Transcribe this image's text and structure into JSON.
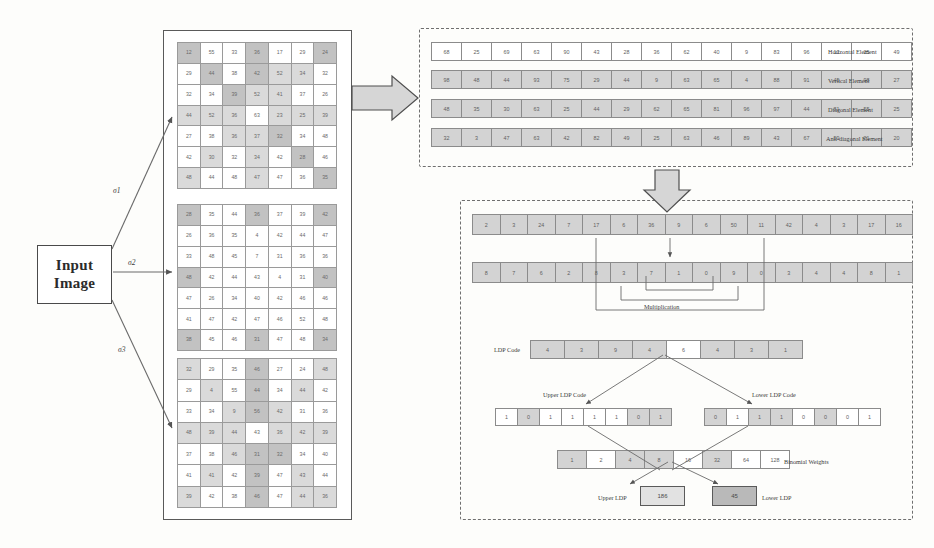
{
  "diagram": {
    "input": {
      "line1": "Input",
      "line2": "Image"
    },
    "sigma_labels": [
      "σ1",
      "σ2",
      "σ3"
    ]
  },
  "grids": [
    {
      "name": "scale-1-grid",
      "rows": 7,
      "cols": 7,
      "values": [
        [
          "12",
          "55",
          "33",
          "36",
          "17",
          "29",
          "24"
        ],
        [
          "29",
          "44",
          "38",
          "42",
          "52",
          "34",
          "32"
        ],
        [
          "32",
          "34",
          "39",
          "52",
          "41",
          "37",
          "26"
        ],
        [
          "44",
          "52",
          "36",
          "63",
          "23",
          "25",
          "39"
        ],
        [
          "27",
          "38",
          "36",
          "37",
          "32",
          "34",
          "48"
        ],
        [
          "42",
          "30",
          "32",
          "34",
          "42",
          "28",
          "46"
        ],
        [
          "48",
          "44",
          "48",
          "47",
          "47",
          "36",
          "35"
        ]
      ],
      "shades": [
        [
          2,
          0,
          0,
          2,
          0,
          0,
          2
        ],
        [
          0,
          2,
          0,
          2,
          1,
          1,
          0
        ],
        [
          0,
          0,
          2,
          1,
          1,
          0,
          0
        ],
        [
          1,
          1,
          1,
          0,
          1,
          1,
          1
        ],
        [
          0,
          0,
          1,
          1,
          2,
          0,
          0
        ],
        [
          0,
          1,
          0,
          1,
          0,
          2,
          0
        ],
        [
          1,
          0,
          0,
          1,
          0,
          0,
          2
        ]
      ]
    },
    {
      "name": "scale-2-grid",
      "rows": 7,
      "cols": 7,
      "values": [
        [
          "28",
          "35",
          "44",
          "36",
          "37",
          "39",
          "42"
        ],
        [
          "26",
          "36",
          "35",
          "4",
          "42",
          "44",
          "47"
        ],
        [
          "33",
          "48",
          "45",
          "7",
          "31",
          "36",
          "36"
        ],
        [
          "48",
          "42",
          "44",
          "43",
          "4",
          "31",
          "40"
        ],
        [
          "47",
          "26",
          "34",
          "40",
          "42",
          "46",
          "46"
        ],
        [
          "41",
          "47",
          "42",
          "47",
          "46",
          "52",
          "48"
        ],
        [
          "38",
          "45",
          "46",
          "31",
          "47",
          "48",
          "34"
        ]
      ],
      "shades": [
        [
          2,
          0,
          0,
          2,
          0,
          0,
          2
        ],
        [
          0,
          0,
          0,
          0,
          0,
          0,
          0
        ],
        [
          0,
          0,
          0,
          0,
          0,
          0,
          0
        ],
        [
          2,
          0,
          0,
          0,
          0,
          0,
          2
        ],
        [
          0,
          0,
          0,
          0,
          0,
          0,
          0
        ],
        [
          0,
          0,
          0,
          0,
          0,
          0,
          0
        ],
        [
          2,
          0,
          0,
          2,
          0,
          0,
          2
        ]
      ]
    },
    {
      "name": "scale-3-grid",
      "rows": 7,
      "cols": 7,
      "values": [
        [
          "32",
          "29",
          "35",
          "46",
          "27",
          "24",
          "48"
        ],
        [
          "29",
          "4",
          "55",
          "44",
          "34",
          "44",
          "42"
        ],
        [
          "33",
          "34",
          "9",
          "56",
          "42",
          "31",
          "36"
        ],
        [
          "48",
          "39",
          "44",
          "43",
          "36",
          "42",
          "39"
        ],
        [
          "37",
          "38",
          "46",
          "31",
          "32",
          "34",
          "40"
        ],
        [
          "41",
          "41",
          "42",
          "39",
          "47",
          "43",
          "44"
        ],
        [
          "39",
          "42",
          "38",
          "46",
          "47",
          "44",
          "36"
        ]
      ],
      "shades": [
        [
          1,
          0,
          0,
          2,
          0,
          0,
          1
        ],
        [
          0,
          1,
          0,
          2,
          0,
          1,
          0
        ],
        [
          0,
          0,
          1,
          2,
          1,
          0,
          0
        ],
        [
          1,
          1,
          1,
          0,
          1,
          1,
          1
        ],
        [
          0,
          0,
          1,
          2,
          2,
          0,
          0
        ],
        [
          0,
          1,
          0,
          2,
          0,
          1,
          0
        ],
        [
          1,
          0,
          0,
          2,
          0,
          1,
          1
        ]
      ]
    }
  ],
  "masks": {
    "label_horizontal": "Horizontal Element",
    "label_vertical": "Vertical Element",
    "label_diagonal": "Diagonal Element",
    "label_antidiagonal": "Anti-diagonal Element",
    "rows": [
      {
        "name": "horizontal-element-row",
        "shade": 0,
        "values": [
          "68",
          "25",
          "69",
          "63",
          "90",
          "43",
          "28",
          "36",
          "62",
          "40",
          "9",
          "83",
          "96",
          "12",
          "25",
          "49"
        ]
      },
      {
        "name": "vertical-element-row",
        "shade": 1,
        "values": [
          "98",
          "48",
          "44",
          "93",
          "75",
          "29",
          "44",
          "9",
          "63",
          "65",
          "4",
          "88",
          "91",
          "45",
          "98",
          "27"
        ]
      },
      {
        "name": "diagonal-element-row",
        "shade": 1,
        "values": [
          "48",
          "35",
          "30",
          "63",
          "25",
          "44",
          "29",
          "62",
          "65",
          "81",
          "96",
          "97",
          "44",
          "81",
          "55",
          "25"
        ]
      },
      {
        "name": "antidiagonal-element-row",
        "shade": 1,
        "values": [
          "32",
          "3",
          "47",
          "63",
          "42",
          "82",
          "49",
          "25",
          "63",
          "46",
          "89",
          "43",
          "67",
          "59",
          "21",
          "20"
        ]
      }
    ]
  },
  "ldp": {
    "row_a": {
      "name": "mask-response-row",
      "values": [
        "2",
        "3",
        "24",
        "7",
        "17",
        "6",
        "36",
        "9",
        "6",
        "50",
        "11",
        "42",
        "4",
        "3",
        "17",
        "16"
      ]
    },
    "row_b": {
      "name": "neighbour-row",
      "values": [
        "8",
        "7",
        "6",
        "2",
        "8",
        "3",
        "7",
        "1",
        "0",
        "9",
        "0",
        "3",
        "4",
        "4",
        "8",
        "1"
      ]
    },
    "multiplication_label": "Multiplication",
    "ldp_code_label": "LDP Code",
    "ldp_code": {
      "name": "ldp-code-row",
      "values": [
        "4",
        "3",
        "9",
        "4",
        "6",
        "4",
        "3",
        "1"
      ],
      "shades": [
        1,
        1,
        1,
        1,
        0,
        1,
        1,
        1
      ]
    },
    "upper_label": "Upper LDP Code",
    "lower_label": "Lower LDP Code",
    "upper_code": {
      "name": "upper-ldp-code-row",
      "values": [
        "1",
        "0",
        "1",
        "1",
        "1",
        "1",
        "0",
        "1"
      ],
      "shades": [
        0,
        1,
        0,
        0,
        0,
        0,
        1,
        1
      ]
    },
    "lower_code": {
      "name": "lower-ldp-code-row",
      "values": [
        "0",
        "1",
        "1",
        "1",
        "0",
        "0",
        "0",
        "1"
      ],
      "shades": [
        1,
        0,
        1,
        1,
        0,
        1,
        0,
        0
      ]
    },
    "weights_label": "Binomial Weights",
    "weights": {
      "name": "binomial-weights-row",
      "values": [
        "1",
        "2",
        "4",
        "8",
        "16",
        "32",
        "64",
        "128"
      ],
      "shades": [
        1,
        0,
        1,
        1,
        0,
        1,
        0,
        0
      ]
    },
    "upper_result_label": "Upper LDP",
    "lower_result_label": "Lower LDP",
    "upper_result": "186",
    "lower_result": "45"
  },
  "colors": {
    "stroke": "#5a5a5a",
    "dash": "#6f6f6f",
    "cell_light": "#dadada",
    "cell_mid": "#c2c2c2",
    "cell_dark": "#ababab",
    "arrow_fill": "#d8d8d8"
  }
}
